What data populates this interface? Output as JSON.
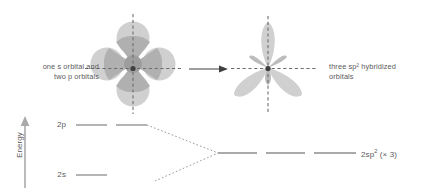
{
  "figure": {
    "caption_left": "one s orbital and\ntwo p orbitals",
    "caption_right": "three sp² hybridized\norbitals",
    "transform_arrow": "right-arrow"
  },
  "energy_diagram": {
    "axis_label": "Energy",
    "axis_arrow": "up-arrow",
    "levels": [
      {
        "id": "2p",
        "label": "2p",
        "label_plain": "2p",
        "orbital_count": 2,
        "y": 125
      },
      {
        "id": "2s",
        "label": "2s",
        "label_plain": "2s",
        "orbital_count": 1,
        "y": 175
      },
      {
        "id": "2sp2",
        "label_prefix": "2sp",
        "label_sup": "2",
        "label_suffix": " (× 3)",
        "label_plain": "2sp² (× 3)",
        "orbital_count": 3,
        "y": 153
      }
    ]
  },
  "colors": {
    "text": "#5a5a5c",
    "line": "#8c8c8e",
    "dashed_axis": "#6f6f71",
    "lobe_light": "#d2d2d2",
    "lobe_mid": "#bdbdbd",
    "lobe_dark": "#a9a9a9",
    "nucleus": "#4d4d4f",
    "background": "#ffffff"
  },
  "orbitals_left": {
    "name": "s-orbital-and-two-p-orbitals",
    "p_lobes": 4,
    "s_petals": 4,
    "has_vertical_dashed_axis": true,
    "has_horizontal_dashed_axis": true
  },
  "orbitals_right": {
    "name": "three-sp2-hybrid-orbitals",
    "major_lobes": 3,
    "minor_back_lobes": 3,
    "lobe_directions_deg": [
      90,
      210,
      330
    ],
    "has_vertical_dashed_axis": true,
    "has_horizontal_dashed_axis": true
  }
}
